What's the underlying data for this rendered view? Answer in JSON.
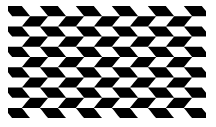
{
  "image": {
    "title": "Wavy Checkerboard Optical Illusion",
    "width": 216,
    "height": 127,
    "background_color": "#ffffff"
  },
  "figure": {
    "name": "wavy-checkerboard",
    "foreground_color": "#000000",
    "background_color": "#ffffff",
    "x": 8,
    "y": 6,
    "width": 198,
    "height": 112,
    "columns": 11,
    "rows": 11,
    "cell_width": 18,
    "cell_height": 10.2,
    "skew_amplitude": 4.2,
    "curve_amplitude": 2.6,
    "row_phase_shift_deg": 90
  },
  "caption": {
    "text": ""
  },
  "chart_data": {
    "type": "heatmap",
    "xlabel": "",
    "ylabel": "",
    "categories": [
      "c0",
      "c1",
      "c2",
      "c3",
      "c4",
      "c5",
      "c6",
      "c7",
      "c8",
      "c9",
      "c10"
    ],
    "x": [
      0,
      1,
      2,
      3,
      4,
      5,
      6,
      7,
      8,
      9,
      10
    ],
    "y": [
      0,
      1,
      2,
      3,
      4,
      5,
      6,
      7,
      8,
      9,
      10
    ],
    "grid": false,
    "legend": "none",
    "colors": [
      "#ffffff",
      "#000000"
    ],
    "values": [
      [
        1,
        0,
        1,
        0,
        1,
        0,
        1,
        0,
        1,
        0,
        1
      ],
      [
        0,
        1,
        0,
        1,
        0,
        1,
        0,
        1,
        0,
        1,
        0
      ],
      [
        1,
        0,
        1,
        0,
        1,
        0,
        1,
        0,
        1,
        0,
        1
      ],
      [
        0,
        1,
        0,
        1,
        0,
        1,
        0,
        1,
        0,
        1,
        0
      ],
      [
        1,
        0,
        1,
        0,
        1,
        0,
        1,
        0,
        1,
        0,
        1
      ],
      [
        0,
        1,
        0,
        1,
        0,
        1,
        0,
        1,
        0,
        1,
        0
      ],
      [
        1,
        0,
        1,
        0,
        1,
        0,
        1,
        0,
        1,
        0,
        1
      ],
      [
        0,
        1,
        0,
        1,
        0,
        1,
        0,
        1,
        0,
        1,
        0
      ],
      [
        1,
        0,
        1,
        0,
        1,
        0,
        1,
        0,
        1,
        0,
        1
      ],
      [
        0,
        1,
        0,
        1,
        0,
        1,
        0,
        1,
        0,
        1,
        0
      ],
      [
        1,
        0,
        1,
        0,
        1,
        0,
        1,
        0,
        1,
        0,
        1
      ]
    ]
  }
}
